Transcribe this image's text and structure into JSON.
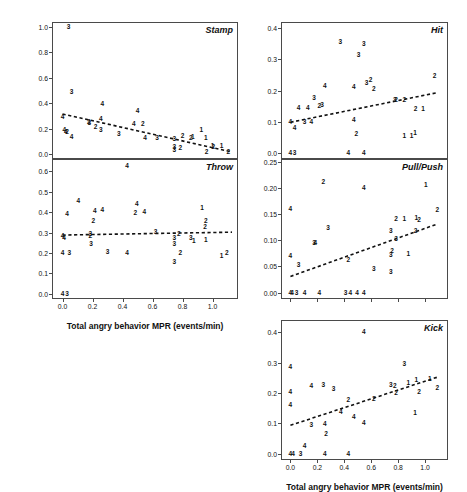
{
  "figure": {
    "y_axis_title": "MPRP (Individual Behavior MPR/Total MPR)",
    "x_axis_title_left": "Total angry behavior MPR (events/min)",
    "x_axis_title_right": "Total angry behavior MPR (events/min)"
  },
  "chart_data": [
    {
      "type": "scatter",
      "title": "Stamp",
      "xlabel": "Total angry behavior MPR (events/min)",
      "ylabel": "MPRP (Individual Behavior MPR/Total MPR)",
      "xlim": [
        -0.07,
        1.17
      ],
      "ylim": [
        -0.04,
        1.04
      ],
      "xticks": [
        0.0,
        0.2,
        0.4,
        0.6,
        0.8,
        1.0
      ],
      "yticks": [
        0.0,
        0.2,
        0.4,
        0.6,
        0.8,
        1.0
      ],
      "xticklabels": [
        "0.0",
        "0.2",
        "0.4",
        "0.6",
        "0.8",
        "1.0"
      ],
      "yticklabels": [
        "0.0",
        "0.2",
        "0.4",
        "0.6",
        "0.8",
        "1.0"
      ],
      "grid": false,
      "legend": "none",
      "point_marker": "group-digit-label",
      "fit_line": {
        "style": "dashed",
        "x0": 0.0,
        "y0": 0.315,
        "x1": 1.13,
        "y1": 0.015
      },
      "points": [
        {
          "x": 0.04,
          "y": 1.0,
          "label": "3"
        },
        {
          "x": 0.06,
          "y": 0.49,
          "label": "3"
        },
        {
          "x": 0.0,
          "y": 0.295,
          "label": "4"
        },
        {
          "x": 0.012,
          "y": 0.185,
          "label": "4"
        },
        {
          "x": 0.022,
          "y": 0.175,
          "label": "4"
        },
        {
          "x": 0.03,
          "y": 0.175,
          "label": "2"
        },
        {
          "x": 0.06,
          "y": 0.135,
          "label": "4"
        },
        {
          "x": 0.175,
          "y": 0.255,
          "label": "2"
        },
        {
          "x": 0.178,
          "y": 0.245,
          "label": "3"
        },
        {
          "x": 0.265,
          "y": 0.395,
          "label": "4"
        },
        {
          "x": 0.255,
          "y": 0.275,
          "label": "4"
        },
        {
          "x": 0.22,
          "y": 0.215,
          "label": "2"
        },
        {
          "x": 0.255,
          "y": 0.185,
          "label": "3"
        },
        {
          "x": 0.375,
          "y": 0.155,
          "label": "3"
        },
        {
          "x": 0.5,
          "y": 0.335,
          "label": "4"
        },
        {
          "x": 0.475,
          "y": 0.235,
          "label": "4"
        },
        {
          "x": 0.535,
          "y": 0.235,
          "label": "2"
        },
        {
          "x": 0.55,
          "y": 0.125,
          "label": "4"
        },
        {
          "x": 0.63,
          "y": 0.125,
          "label": "3"
        },
        {
          "x": 0.745,
          "y": 0.115,
          "label": "3"
        },
        {
          "x": 0.745,
          "y": 0.055,
          "label": "3"
        },
        {
          "x": 0.745,
          "y": 0.03,
          "label": "3"
        },
        {
          "x": 0.785,
          "y": 0.05,
          "label": "2"
        },
        {
          "x": 0.8,
          "y": 0.145,
          "label": "2"
        },
        {
          "x": 0.855,
          "y": 0.125,
          "label": "2"
        },
        {
          "x": 0.868,
          "y": 0.135,
          "label": "1"
        },
        {
          "x": 0.925,
          "y": 0.185,
          "label": "1"
        },
        {
          "x": 0.955,
          "y": 0.125,
          "label": "1"
        },
        {
          "x": 0.96,
          "y": 0.015,
          "label": "2"
        },
        {
          "x": 1.0,
          "y": 0.06,
          "label": "1"
        },
        {
          "x": 1.005,
          "y": 0.055,
          "label": "2"
        },
        {
          "x": 1.06,
          "y": 0.06,
          "label": "1"
        },
        {
          "x": 1.105,
          "y": 0.015,
          "label": "2"
        }
      ]
    },
    {
      "type": "scatter",
      "title": "Throw",
      "xlabel": "Total angry behavior MPR (events/min)",
      "ylabel": "MPRP (Individual Behavior MPR/Total MPR)",
      "xlim": [
        -0.07,
        1.17
      ],
      "ylim": [
        -0.025,
        0.66
      ],
      "xticks": [
        0.0,
        0.2,
        0.4,
        0.6,
        0.8,
        1.0
      ],
      "yticks": [
        0.0,
        0.1,
        0.2,
        0.3,
        0.4,
        0.5,
        0.6
      ],
      "xticklabels": [
        "0.0",
        "0.2",
        "0.4",
        "0.6",
        "0.8",
        "1.0"
      ],
      "yticklabels": [
        "0.0",
        "0.1",
        "0.2",
        "0.3",
        "0.4",
        "0.5",
        "0.6"
      ],
      "grid": false,
      "legend": "none",
      "point_marker": "group-digit-label",
      "fit_line": {
        "style": "dashed",
        "x0": 0.0,
        "y0": 0.288,
        "x1": 1.13,
        "y1": 0.302
      },
      "points": [
        {
          "x": 0.43,
          "y": 0.625,
          "label": "4"
        },
        {
          "x": 0.105,
          "y": 0.455,
          "label": "4"
        },
        {
          "x": 0.03,
          "y": 0.39,
          "label": "4"
        },
        {
          "x": 0.215,
          "y": 0.405,
          "label": "4"
        },
        {
          "x": 0.205,
          "y": 0.355,
          "label": "2"
        },
        {
          "x": 0.265,
          "y": 0.41,
          "label": "4"
        },
        {
          "x": 0.495,
          "y": 0.44,
          "label": "4"
        },
        {
          "x": 0.485,
          "y": 0.395,
          "label": "2"
        },
        {
          "x": 0.545,
          "y": 0.4,
          "label": "4"
        },
        {
          "x": 0.93,
          "y": 0.42,
          "label": "1"
        },
        {
          "x": 0.955,
          "y": 0.355,
          "label": "2"
        },
        {
          "x": 0.95,
          "y": 0.325,
          "label": "2"
        },
        {
          "x": 0.0,
          "y": 0.285,
          "label": "4"
        },
        {
          "x": 0.01,
          "y": 0.275,
          "label": "4"
        },
        {
          "x": 0.185,
          "y": 0.295,
          "label": "3"
        },
        {
          "x": 0.185,
          "y": 0.285,
          "label": "2"
        },
        {
          "x": 0.62,
          "y": 0.305,
          "label": "3"
        },
        {
          "x": 0.775,
          "y": 0.295,
          "label": "2"
        },
        {
          "x": 0.745,
          "y": 0.275,
          "label": "3"
        },
        {
          "x": 0.855,
          "y": 0.275,
          "label": "3"
        },
        {
          "x": 0.875,
          "y": 0.26,
          "label": "1"
        },
        {
          "x": 0.955,
          "y": 0.265,
          "label": "1"
        },
        {
          "x": 0.19,
          "y": 0.245,
          "label": "3"
        },
        {
          "x": 0.745,
          "y": 0.245,
          "label": "3"
        },
        {
          "x": 0.0,
          "y": 0.2,
          "label": "4"
        },
        {
          "x": 0.045,
          "y": 0.2,
          "label": "3"
        },
        {
          "x": 0.3,
          "y": 0.205,
          "label": "3"
        },
        {
          "x": 0.43,
          "y": 0.2,
          "label": "4"
        },
        {
          "x": 0.785,
          "y": 0.2,
          "label": "2"
        },
        {
          "x": 1.06,
          "y": 0.185,
          "label": "1"
        },
        {
          "x": 1.095,
          "y": 0.2,
          "label": "2"
        },
        {
          "x": 0.745,
          "y": 0.155,
          "label": "3"
        },
        {
          "x": 0.0,
          "y": 0.0,
          "label": "4"
        },
        {
          "x": 0.03,
          "y": 0.0,
          "label": "3"
        }
      ]
    },
    {
      "type": "scatter",
      "title": "Hit",
      "xlabel": "Total angry behavior MPR (events/min)",
      "ylabel": "MPRP (Individual Behavior MPR/Total MPR)",
      "xlim": [
        -0.07,
        1.17
      ],
      "ylim": [
        -0.02,
        0.42
      ],
      "xticks": [
        0.0,
        0.2,
        0.4,
        0.6,
        0.8,
        1.0
      ],
      "yticks": [
        0.0,
        0.1,
        0.2,
        0.3,
        0.4
      ],
      "xticklabels": [
        "0.0",
        "0.2",
        "0.4",
        "0.6",
        "0.8",
        "1.0"
      ],
      "yticklabels": [
        "0.0",
        "0.1",
        "0.2",
        "0.3",
        "0.4"
      ],
      "grid": false,
      "legend": "none",
      "point_marker": "group-digit-label",
      "fit_line": {
        "style": "dashed",
        "x0": 0.0,
        "y0": 0.098,
        "x1": 1.09,
        "y1": 0.193
      },
      "points": [
        {
          "x": 0.37,
          "y": 0.355,
          "label": "3"
        },
        {
          "x": 0.545,
          "y": 0.35,
          "label": "3"
        },
        {
          "x": 0.505,
          "y": 0.315,
          "label": "3"
        },
        {
          "x": 0.565,
          "y": 0.225,
          "label": "3"
        },
        {
          "x": 0.595,
          "y": 0.235,
          "label": "2"
        },
        {
          "x": 1.07,
          "y": 0.245,
          "label": "2"
        },
        {
          "x": 0.255,
          "y": 0.215,
          "label": "4"
        },
        {
          "x": 0.47,
          "y": 0.21,
          "label": "4"
        },
        {
          "x": 0.62,
          "y": 0.205,
          "label": "2"
        },
        {
          "x": 0.175,
          "y": 0.175,
          "label": "3"
        },
        {
          "x": 0.775,
          "y": 0.17,
          "label": "3"
        },
        {
          "x": 0.785,
          "y": 0.168,
          "label": "2"
        },
        {
          "x": 0.845,
          "y": 0.168,
          "label": "2"
        },
        {
          "x": 0.06,
          "y": 0.145,
          "label": "4"
        },
        {
          "x": 0.13,
          "y": 0.145,
          "label": "4"
        },
        {
          "x": 0.215,
          "y": 0.15,
          "label": "2"
        },
        {
          "x": 0.235,
          "y": 0.155,
          "label": "3"
        },
        {
          "x": 0.93,
          "y": 0.14,
          "label": "2"
        },
        {
          "x": 0.985,
          "y": 0.14,
          "label": "1"
        },
        {
          "x": 0.0,
          "y": 0.1,
          "label": "4"
        },
        {
          "x": 0.105,
          "y": 0.098,
          "label": "3"
        },
        {
          "x": 0.155,
          "y": 0.098,
          "label": "4"
        },
        {
          "x": 0.47,
          "y": 0.105,
          "label": "4"
        },
        {
          "x": 0.03,
          "y": 0.078,
          "label": "4"
        },
        {
          "x": 0.49,
          "y": 0.06,
          "label": "2"
        },
        {
          "x": 0.845,
          "y": 0.055,
          "label": "1"
        },
        {
          "x": 0.9,
          "y": 0.055,
          "label": "1"
        },
        {
          "x": 0.925,
          "y": 0.062,
          "label": "1"
        },
        {
          "x": 0.0,
          "y": 0.0,
          "label": "4"
        },
        {
          "x": 0.03,
          "y": 0.0,
          "label": "3"
        },
        {
          "x": 0.43,
          "y": 0.0,
          "label": "4"
        },
        {
          "x": 0.545,
          "y": 0.0,
          "label": "4"
        }
      ]
    },
    {
      "type": "scatter",
      "title": "Pull/Push",
      "xlabel": "Total angry behavior MPR (events/min)",
      "ylabel": "MPRP (Individual Behavior MPR/Total MPR)",
      "xlim": [
        -0.07,
        1.17
      ],
      "ylim": [
        -0.012,
        0.255
      ],
      "xticks": [
        0.0,
        0.2,
        0.4,
        0.6,
        0.8,
        1.0
      ],
      "yticks": [
        0.0,
        0.05,
        0.1,
        0.15,
        0.2,
        0.25
      ],
      "xticklabels": [
        "0.00",
        "0.05",
        "0.10",
        "0.15",
        "0.20",
        "0.25"
      ],
      "yticklabels": [
        "0.00",
        "0.05",
        "0.10",
        "0.15",
        "0.20",
        "0.25"
      ],
      "grid": false,
      "legend": "none",
      "point_marker": "group-digit-label",
      "fit_line": {
        "style": "dashed",
        "x0": 0.0,
        "y0": 0.031,
        "x1": 1.09,
        "y1": 0.131
      },
      "points": [
        {
          "x": 0.245,
          "y": 0.212,
          "label": "2"
        },
        {
          "x": 0.545,
          "y": 0.2,
          "label": "4"
        },
        {
          "x": 1.005,
          "y": 0.205,
          "label": "1"
        },
        {
          "x": 0.0,
          "y": 0.16,
          "label": "4"
        },
        {
          "x": 1.09,
          "y": 0.158,
          "label": "2"
        },
        {
          "x": 0.785,
          "y": 0.14,
          "label": "2"
        },
        {
          "x": 0.845,
          "y": 0.14,
          "label": "1"
        },
        {
          "x": 0.935,
          "y": 0.142,
          "label": "1"
        },
        {
          "x": 0.955,
          "y": 0.138,
          "label": "2"
        },
        {
          "x": 0.28,
          "y": 0.124,
          "label": "3"
        },
        {
          "x": 0.745,
          "y": 0.118,
          "label": "3"
        },
        {
          "x": 0.93,
          "y": 0.118,
          "label": "2"
        },
        {
          "x": 0.175,
          "y": 0.095,
          "label": "3"
        },
        {
          "x": 0.185,
          "y": 0.095,
          "label": "4"
        },
        {
          "x": 0.785,
          "y": 0.103,
          "label": "3"
        },
        {
          "x": 0.755,
          "y": 0.08,
          "label": "2"
        },
        {
          "x": 0.745,
          "y": 0.072,
          "label": "3"
        },
        {
          "x": 0.0,
          "y": 0.07,
          "label": "4"
        },
        {
          "x": 0.875,
          "y": 0.073,
          "label": "1"
        },
        {
          "x": 0.43,
          "y": 0.062,
          "label": "2"
        },
        {
          "x": 0.06,
          "y": 0.052,
          "label": "3"
        },
        {
          "x": 0.62,
          "y": 0.046,
          "label": "3"
        },
        {
          "x": 0.745,
          "y": 0.04,
          "label": "3"
        },
        {
          "x": 0.0,
          "y": 0.0,
          "label": "4"
        },
        {
          "x": 0.012,
          "y": 0.0,
          "label": "4"
        },
        {
          "x": 0.045,
          "y": 0.0,
          "label": "3"
        },
        {
          "x": 0.105,
          "y": 0.0,
          "label": "4"
        },
        {
          "x": 0.215,
          "y": 0.0,
          "label": "4"
        },
        {
          "x": 0.41,
          "y": 0.0,
          "label": "3"
        },
        {
          "x": 0.445,
          "y": 0.0,
          "label": "4"
        },
        {
          "x": 0.495,
          "y": 0.0,
          "label": "4"
        },
        {
          "x": 0.545,
          "y": 0.0,
          "label": "4"
        }
      ]
    },
    {
      "type": "scatter",
      "title": "Kick",
      "xlabel": "Total angry behavior MPR (events/min)",
      "ylabel": "MPRP (Individual Behavior MPR/Total MPR)",
      "xlim": [
        -0.07,
        1.17
      ],
      "ylim": [
        -0.02,
        0.44
      ],
      "xticks": [
        0.0,
        0.2,
        0.4,
        0.6,
        0.8,
        1.0
      ],
      "yticks": [
        0.0,
        0.1,
        0.2,
        0.3,
        0.4
      ],
      "xticklabels": [
        "0.0",
        "0.2",
        "0.4",
        "0.6",
        "0.8",
        "1.0"
      ],
      "yticklabels": [
        "0.0",
        "0.1",
        "0.2",
        "0.3",
        "0.4"
      ],
      "grid": false,
      "legend": "none",
      "point_marker": "group-digit-label",
      "fit_line": {
        "style": "dashed",
        "x0": 0.0,
        "y0": 0.094,
        "x1": 1.09,
        "y1": 0.252
      },
      "points": [
        {
          "x": 0.545,
          "y": 0.4,
          "label": "4"
        },
        {
          "x": 0.0,
          "y": 0.285,
          "label": "4"
        },
        {
          "x": 0.845,
          "y": 0.297,
          "label": "3"
        },
        {
          "x": 0.0,
          "y": 0.205,
          "label": "4"
        },
        {
          "x": 0.155,
          "y": 0.222,
          "label": "4"
        },
        {
          "x": 0.245,
          "y": 0.225,
          "label": "3"
        },
        {
          "x": 0.32,
          "y": 0.212,
          "label": "3"
        },
        {
          "x": 0.745,
          "y": 0.228,
          "label": "3"
        },
        {
          "x": 0.775,
          "y": 0.222,
          "label": "2"
        },
        {
          "x": 0.875,
          "y": 0.232,
          "label": "1"
        },
        {
          "x": 0.935,
          "y": 0.242,
          "label": "1"
        },
        {
          "x": 1.035,
          "y": 0.245,
          "label": "1"
        },
        {
          "x": 1.09,
          "y": 0.215,
          "label": "2"
        },
        {
          "x": 0.955,
          "y": 0.205,
          "label": "2"
        },
        {
          "x": 0.785,
          "y": 0.2,
          "label": "2"
        },
        {
          "x": 0.43,
          "y": 0.178,
          "label": "2"
        },
        {
          "x": 0.62,
          "y": 0.182,
          "label": "2"
        },
        {
          "x": 0.0,
          "y": 0.162,
          "label": "4"
        },
        {
          "x": 0.925,
          "y": 0.135,
          "label": "1"
        },
        {
          "x": 0.375,
          "y": 0.138,
          "label": "4"
        },
        {
          "x": 0.47,
          "y": 0.122,
          "label": "4"
        },
        {
          "x": 0.255,
          "y": 0.098,
          "label": "4"
        },
        {
          "x": 0.545,
          "y": 0.1,
          "label": "4"
        },
        {
          "x": 0.155,
          "y": 0.095,
          "label": "3"
        },
        {
          "x": 0.265,
          "y": 0.065,
          "label": "2"
        },
        {
          "x": 0.105,
          "y": 0.025,
          "label": "4"
        },
        {
          "x": 0.0,
          "y": 0.0,
          "label": "4"
        },
        {
          "x": 0.02,
          "y": 0.0,
          "label": "4"
        },
        {
          "x": 0.075,
          "y": 0.0,
          "label": "3"
        },
        {
          "x": 0.255,
          "y": 0.0,
          "label": "4"
        },
        {
          "x": 0.43,
          "y": 0.0,
          "label": "4"
        }
      ]
    }
  ]
}
